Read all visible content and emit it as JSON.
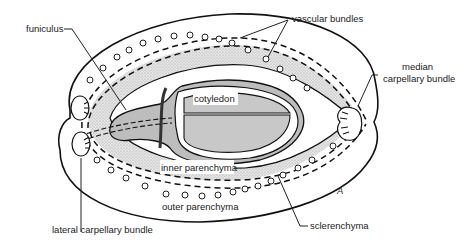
{
  "figure": {
    "panel_letter": "A"
  },
  "labels": {
    "funiculus": "funiculus",
    "vascular_bundles": "vascular bundles",
    "median_carpellary_bundle_line1": "median",
    "median_carpellary_bundle_line2": "carpellary bundle",
    "cotyledon": "cotyledon",
    "inner_parenchyma": "inner parenchyma",
    "outer_parenchyma": "outer parenchyma",
    "lateral_carpellary_bundle": "lateral carpellary bundle",
    "sclerenchyma": "sclerenchyma"
  },
  "colors": {
    "stipple": "#d9d9d9",
    "seed_fill": "#bdbdbd",
    "cotyledon_fill": "#c8c8c8",
    "line": "#111111",
    "background": "#ffffff"
  }
}
